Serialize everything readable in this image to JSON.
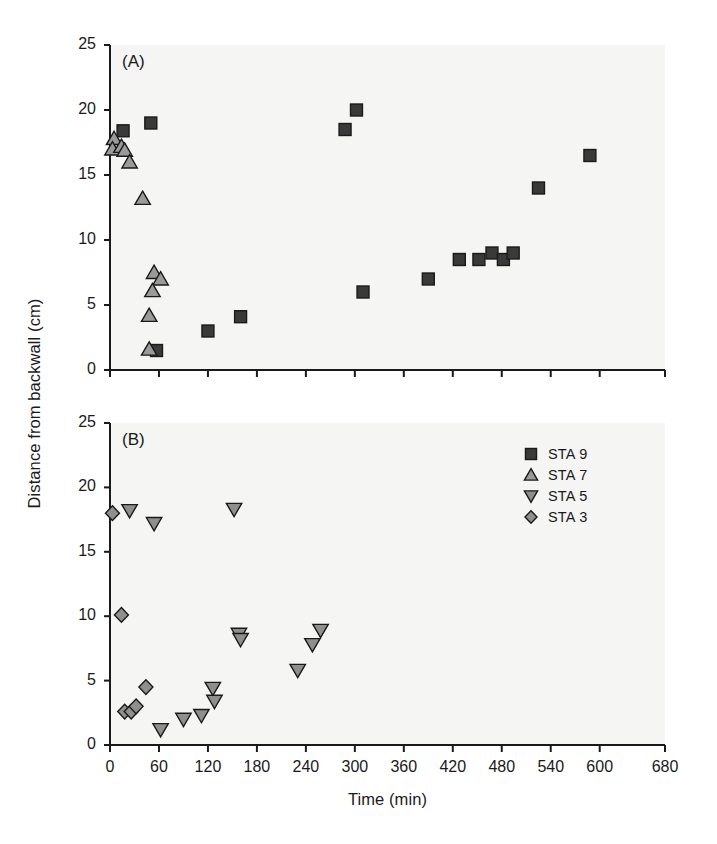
{
  "figure": {
    "cropped_header_text": "",
    "xlabel": "Time (min)",
    "ylabel": "Distance from backwall (cm)"
  },
  "legend": {
    "position": "upper-right-of-panel-B",
    "entries": [
      {
        "label": "STA 9",
        "marker": "square",
        "fill": "#3a3a3a",
        "edge": "#1a1a1a",
        "data_name": "legend-item-sta-9"
      },
      {
        "label": "STA 7",
        "marker": "triangle-up",
        "fill": "#9a9a9a",
        "edge": "#1a1a1a",
        "data_name": "legend-item-sta-7"
      },
      {
        "label": "STA 5",
        "marker": "triangle-down",
        "fill": "#8f8f8f",
        "edge": "#1a1a1a",
        "data_name": "legend-item-sta-5"
      },
      {
        "label": "STA 3",
        "marker": "diamond",
        "fill": "#8f8f8f",
        "edge": "#1a1a1a",
        "data_name": "legend-item-sta-3"
      }
    ]
  },
  "chart_data": [
    {
      "id": "panel-A",
      "type": "scatter",
      "title": "(A)",
      "xlabel": "",
      "ylabel": "Distance from backwall (cm)",
      "xlim": [
        0,
        680
      ],
      "ylim": [
        0,
        25
      ],
      "xticks": [
        0,
        60,
        120,
        180,
        240,
        300,
        360,
        420,
        480,
        540,
        600,
        680
      ],
      "xticklabels": [
        "",
        "",
        "",
        "",
        "",
        "",
        "",
        "",
        "",
        "",
        "",
        ""
      ],
      "yticks": [
        0,
        5,
        10,
        15,
        20,
        25
      ],
      "yticklabels": [
        "0",
        "5",
        "10",
        "15",
        "20",
        "25"
      ],
      "grid": false,
      "legend": false,
      "series": [
        {
          "name": "STA 9",
          "marker": "square",
          "fill": "#3a3a3a",
          "edge": "#1a1a1a",
          "size": 13,
          "points": [
            [
              16,
              18.4
            ],
            [
              50,
              19.0
            ],
            [
              57,
              1.5
            ],
            [
              120,
              3.0
            ],
            [
              160,
              4.1
            ],
            [
              288,
              18.5
            ],
            [
              302,
              20.0
            ],
            [
              310,
              6.0
            ],
            [
              390,
              7.0
            ],
            [
              428,
              8.5
            ],
            [
              452,
              8.5
            ],
            [
              468,
              9.0
            ],
            [
              482,
              8.5
            ],
            [
              494,
              9.0
            ],
            [
              525,
              14.0
            ],
            [
              588,
              16.5
            ]
          ]
        },
        {
          "name": "STA 7",
          "marker": "triangle-up",
          "fill": "#9a9a9a",
          "edge": "#1a1a1a",
          "size": 14,
          "points": [
            [
              5,
              17.8
            ],
            [
              3,
              17.0
            ],
            [
              14,
              17.2
            ],
            [
              18,
              16.9
            ],
            [
              24,
              16.0
            ],
            [
              40,
              13.2
            ],
            [
              54,
              7.5
            ],
            [
              62,
              7.0
            ],
            [
              52,
              6.1
            ],
            [
              48,
              4.2
            ],
            [
              48,
              1.6
            ]
          ]
        }
      ]
    },
    {
      "id": "panel-B",
      "type": "scatter",
      "title": "(B)",
      "xlabel": "Time (min)",
      "ylabel": "Distance from backwall (cm)",
      "xlim": [
        0,
        680
      ],
      "ylim": [
        0,
        25
      ],
      "xticks": [
        0,
        60,
        120,
        180,
        240,
        300,
        360,
        420,
        480,
        540,
        600,
        680
      ],
      "xticklabels": [
        "0",
        "60",
        "120",
        "180",
        "240",
        "300",
        "360",
        "420",
        "480",
        "540",
        "600",
        "680"
      ],
      "yticks": [
        0,
        5,
        10,
        15,
        20,
        25
      ],
      "yticklabels": [
        "0",
        "5",
        "10",
        "15",
        "20",
        "25"
      ],
      "grid": false,
      "legend": true,
      "series": [
        {
          "name": "STA 5",
          "marker": "triangle-down",
          "fill": "#8f8f8f",
          "edge": "#1a1a1a",
          "size": 14,
          "points": [
            [
              24,
              18.2
            ],
            [
              54,
              17.2
            ],
            [
              152,
              18.3
            ],
            [
              62,
              1.2
            ],
            [
              90,
              2.0
            ],
            [
              112,
              2.3
            ],
            [
              126,
              4.4
            ],
            [
              128,
              3.4
            ],
            [
              158,
              8.6
            ],
            [
              160,
              8.2
            ],
            [
              230,
              5.8
            ],
            [
              248,
              7.8
            ],
            [
              258,
              8.9
            ]
          ]
        },
        {
          "name": "STA 3",
          "marker": "diamond",
          "fill": "#8f8f8f",
          "edge": "#1a1a1a",
          "size": 14,
          "points": [
            [
              3,
              18.0
            ],
            [
              14,
              10.1
            ],
            [
              18,
              2.6
            ],
            [
              26,
              2.6
            ],
            [
              32,
              3.0
            ],
            [
              44,
              4.5
            ]
          ]
        }
      ]
    }
  ]
}
